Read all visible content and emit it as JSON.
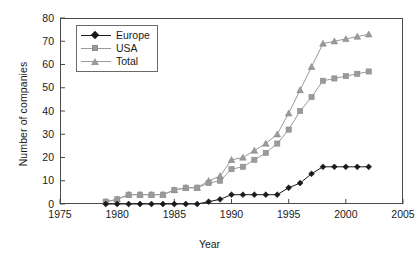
{
  "chart_data": {
    "type": "line",
    "title": "",
    "xlabel": "Year",
    "ylabel": "Number of companies",
    "xlim": [
      1975,
      2005
    ],
    "ylim": [
      0,
      80
    ],
    "xticks": [
      1975,
      1980,
      1985,
      1990,
      1995,
      2000,
      2005
    ],
    "yticks": [
      0,
      10,
      20,
      30,
      40,
      50,
      60,
      70,
      80
    ],
    "grid": false,
    "legend_position": "upper left",
    "x": [
      1979,
      1980,
      1981,
      1982,
      1983,
      1984,
      1985,
      1986,
      1987,
      1988,
      1989,
      1990,
      1991,
      1992,
      1993,
      1994,
      1995,
      1996,
      1997,
      1998,
      1999,
      2000,
      2001,
      2002
    ],
    "series": [
      {
        "name": "Europe",
        "color": "#1a1a1a",
        "marker": "diamond",
        "values": [
          0,
          0,
          0,
          0,
          0,
          0,
          0,
          0,
          0,
          1,
          2,
          4,
          4,
          4,
          4,
          4,
          7,
          9,
          13,
          16,
          16,
          16,
          16,
          16
        ]
      },
      {
        "name": "USA",
        "color": "#9a9a9a",
        "marker": "square",
        "values": [
          1,
          2,
          4,
          4,
          4,
          4,
          6,
          7,
          7,
          9,
          10,
          15,
          16,
          19,
          22,
          26,
          32,
          40,
          46,
          53,
          54,
          55,
          56,
          57
        ]
      },
      {
        "name": "Total",
        "color": "#9a9a9a",
        "marker": "triangle",
        "values": [
          1,
          2,
          4,
          4,
          4,
          4,
          6,
          7,
          7,
          10,
          12,
          19,
          20,
          23,
          26,
          30,
          39,
          49,
          59,
          69,
          70,
          71,
          72,
          73
        ]
      }
    ]
  },
  "legend": {
    "items": [
      {
        "label": "Europe"
      },
      {
        "label": "USA"
      },
      {
        "label": "Total"
      }
    ]
  },
  "caption": ""
}
